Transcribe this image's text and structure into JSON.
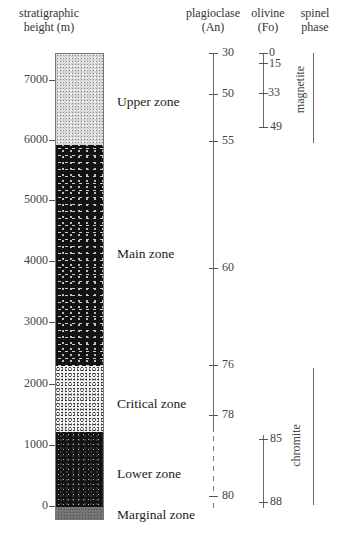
{
  "headers": {
    "height_axis": [
      "stratigraphic",
      "height (m)"
    ],
    "plagioclase": [
      "plagioclase",
      "(An)"
    ],
    "olivine": [
      "olivine",
      "(Fo)"
    ],
    "spinel": [
      "spinel",
      "phase"
    ]
  },
  "height_axis": {
    "ticks": [
      {
        "label": "7000",
        "y": 80
      },
      {
        "label": "6000",
        "y": 140
      },
      {
        "label": "5000",
        "y": 200
      },
      {
        "label": "4000",
        "y": 261
      },
      {
        "label": "3000",
        "y": 322
      },
      {
        "label": "2000",
        "y": 384
      },
      {
        "label": "1000",
        "y": 445
      },
      {
        "label": "0",
        "y": 506
      }
    ]
  },
  "zones": [
    {
      "name": "Upper zone",
      "from_m": 5900,
      "to_m": 7450,
      "pattern": "fine-grey-stipple"
    },
    {
      "name": "Main zone",
      "from_m": 2300,
      "to_m": 5900,
      "pattern": "dark-with-light-flecks"
    },
    {
      "name": "Critical zone",
      "from_m": 1200,
      "to_m": 2300,
      "pattern": "light-with-dark-flecks"
    },
    {
      "name": "Lower zone",
      "from_m": 0,
      "to_m": 1200,
      "pattern": "dark-with-light-dots"
    },
    {
      "name": "Marginal zone",
      "from_m": -230,
      "to_m": 0,
      "pattern": "mottled-grey"
    }
  ],
  "plagioclase": {
    "ticks": [
      {
        "label": "30",
        "y": 53
      },
      {
        "label": "50",
        "y": 94
      },
      {
        "label": "55",
        "y": 141
      },
      {
        "label": "60",
        "y": 268
      },
      {
        "label": "76",
        "y": 365
      },
      {
        "label": "78",
        "y": 415
      },
      {
        "label": "80",
        "y": 496
      }
    ],
    "solid_range_y": [
      53,
      432
    ],
    "dashed_range_y": [
      432,
      508
    ]
  },
  "olivine": {
    "segments": [
      {
        "range_y": [
          53,
          127
        ],
        "ticks": [
          {
            "label": "0",
            "y": 53
          },
          {
            "label": "15",
            "y": 63
          },
          {
            "label": "33",
            "y": 93
          },
          {
            "label": "49",
            "y": 127
          }
        ]
      },
      {
        "range_y": [
          435,
          508
        ],
        "ticks": [
          {
            "label": "85",
            "y": 439
          },
          {
            "label": "88",
            "y": 502
          }
        ]
      }
    ]
  },
  "spinel": {
    "phases": [
      {
        "name": "magnetite",
        "range_y": [
          53,
          143
        ]
      },
      {
        "name": "chromite",
        "range_y": [
          368,
          505
        ]
      }
    ]
  }
}
